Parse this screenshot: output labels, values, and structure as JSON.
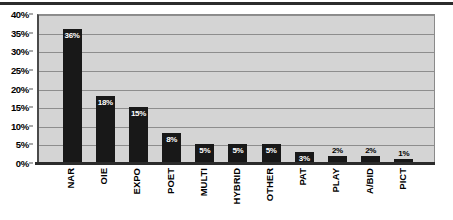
{
  "chart_data": {
    "type": "bar",
    "title": "",
    "subtitle": "",
    "xlabel": "",
    "ylabel": "",
    "ylim": [
      0,
      40
    ],
    "y_unit": "%",
    "grid": true,
    "legend": "none",
    "orientation": "vertical",
    "y_ticks": [
      "0%",
      "5%",
      "10%",
      "15%",
      "20%",
      "25%",
      "30%",
      "35%",
      "40%"
    ],
    "y_tick_values": [
      0,
      5,
      10,
      15,
      20,
      25,
      30,
      35,
      40
    ],
    "categories": [
      "NAR",
      "OIE",
      "EXPO",
      "POET",
      "MULTI",
      "HYBRID",
      "OTHER",
      "PAT",
      "PLAY",
      "A/BID",
      "PICT"
    ],
    "values": [
      36,
      18,
      15,
      8,
      5,
      5,
      5,
      3,
      2,
      2,
      1
    ],
    "data_labels": [
      "36%",
      "18%",
      "15%",
      "8%",
      "5%",
      "5%",
      "5%",
      "3%",
      "2%",
      "2%",
      "1%"
    ],
    "label_placement": [
      "inside",
      "inside",
      "inside",
      "inside",
      "inside",
      "inside",
      "inside",
      "inside",
      "outside",
      "outside",
      "outside"
    ],
    "colors": {
      "bar": "#181818",
      "plot_background": "#d4d4d4",
      "gridline": "#8d8d8d",
      "axis": "#2b2b2b",
      "label_inside": "#ffffff",
      "label_outside": "#000000",
      "page_background": "#ffffff"
    }
  }
}
